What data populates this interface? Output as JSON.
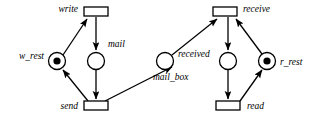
{
  "figure": {
    "kind": "petri-net",
    "background_color": "#ffffff",
    "stroke_color": "#000000"
  },
  "places": [
    {
      "id": "w_rest",
      "label": "w_rest",
      "cx": 57,
      "cy": 61,
      "r": 8.5,
      "tokens": 1,
      "label_x": 44,
      "label_y": 57,
      "anchor": "end"
    },
    {
      "id": "mail",
      "label": "mail",
      "cx": 96,
      "cy": 61,
      "r": 8.5,
      "tokens": 0,
      "label_x": 108,
      "label_y": 45,
      "anchor": "start"
    },
    {
      "id": "mail_box",
      "label": "mail_box",
      "cx": 165,
      "cy": 61,
      "r": 8.5,
      "tokens": 0,
      "label_x": 153,
      "label_y": 78,
      "anchor": "start"
    },
    {
      "id": "received",
      "label": "received",
      "cx": 228,
      "cy": 61,
      "r": 8.5,
      "tokens": 0,
      "label_x": 178,
      "label_y": 55,
      "anchor": "start"
    },
    {
      "id": "r_rest",
      "label": "r_rest",
      "cx": 267,
      "cy": 61,
      "r": 8.5,
      "tokens": 1,
      "label_x": 280,
      "label_y": 63,
      "anchor": "start"
    }
  ],
  "transitions": [
    {
      "id": "write",
      "label": "write",
      "x": 84,
      "y": 7,
      "w": 24,
      "h": 9,
      "label_x": 78,
      "label_y": 10,
      "anchor": "end"
    },
    {
      "id": "send",
      "label": "send",
      "x": 84,
      "y": 101,
      "w": 24,
      "h": 9,
      "label_x": 78,
      "label_y": 107,
      "anchor": "end"
    },
    {
      "id": "receive",
      "label": "receive",
      "x": 213,
      "y": 7,
      "w": 24,
      "h": 9,
      "label_x": 243,
      "label_y": 10,
      "anchor": "start"
    },
    {
      "id": "read",
      "label": "read",
      "x": 216,
      "y": 101,
      "w": 24,
      "h": 9,
      "label_x": 247,
      "label_y": 107,
      "anchor": "start"
    }
  ],
  "arcs": [
    {
      "id": "w_rest-to-write",
      "from": "w_rest",
      "to": "write",
      "x1": 63,
      "y1": 55,
      "x2": 87,
      "y2": 19
    },
    {
      "id": "write-to-mail",
      "from": "write",
      "to": "mail",
      "x1": 96,
      "y1": 17,
      "x2": 96,
      "y2": 50
    },
    {
      "id": "mail-to-send",
      "from": "mail",
      "to": "send",
      "x1": 96,
      "y1": 70,
      "x2": 96,
      "y2": 99
    },
    {
      "id": "send-to-w_rest",
      "from": "send",
      "to": "w_rest",
      "x1": 88,
      "y1": 101,
      "x2": 63,
      "y2": 70
    },
    {
      "id": "send-to-mail_box",
      "from": "send",
      "to": "mail_box",
      "x1": 105,
      "y1": 101,
      "x2": 172,
      "y2": 67
    },
    {
      "id": "mail_box-to-receive",
      "from": "mail_box",
      "to": "receive",
      "x1": 172,
      "y1": 55,
      "x2": 217,
      "y2": 19
    },
    {
      "id": "receive-to-received",
      "from": "receive",
      "to": "received",
      "x1": 228,
      "y1": 17,
      "x2": 228,
      "y2": 50
    },
    {
      "id": "received-to-read",
      "from": "received",
      "to": "read",
      "x1": 228,
      "y1": 70,
      "x2": 228,
      "y2": 99
    },
    {
      "id": "read-to-r_rest",
      "from": "read",
      "to": "r_rest",
      "x1": 240,
      "y1": 101,
      "x2": 262,
      "y2": 70
    },
    {
      "id": "r_rest-to-receive",
      "from": "r_rest",
      "to": "receive",
      "x1": 262,
      "y1": 54,
      "x2": 236,
      "y2": 19
    }
  ]
}
